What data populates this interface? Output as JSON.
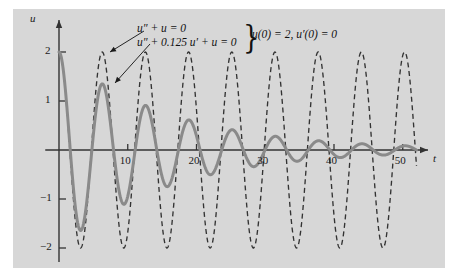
{
  "figure": {
    "background": "#ffffff",
    "panel_color": "#d7d7d7",
    "axis_color": "#333333",
    "solid_curve_color": "#8a8a8a",
    "dashed_curve_color": "#333333"
  },
  "axes": {
    "x_axis_label": "t",
    "y_axis_label": "u",
    "x_ticks": [
      10,
      20,
      30,
      40,
      50
    ],
    "x_tick_labels": [
      "10",
      "20",
      "30",
      "40",
      "50"
    ],
    "y_ticks": [
      2,
      1,
      -1,
      -2
    ],
    "y_tick_labels": [
      "2",
      "1",
      "−1",
      "−2"
    ],
    "x_range": [
      -1,
      54
    ],
    "y_range": [
      -2.45,
      2.45
    ]
  },
  "annotations": {
    "equation_undamped": "u″ + u = 0",
    "equation_damped": "u″ + 0.125 u′ + u = 0",
    "brace": "}",
    "initial_conditions": "u(0) = 2, u′(0) = 0"
  },
  "chart_data": {
    "type": "line",
    "title": "",
    "xlabel": "t",
    "ylabel": "u",
    "xlim": [
      -1,
      54
    ],
    "ylim": [
      -2.45,
      2.45
    ],
    "grid": false,
    "legend": "annotated-with-arrows",
    "series": [
      {
        "name": "u″ + u = 0",
        "style": "dashed",
        "color": "#333333",
        "formula": "2*cos(t)",
        "amplitude": 2,
        "damping": 0,
        "period": 6.2832,
        "initial_value": 2,
        "initial_derivative": 0,
        "t_start": 0,
        "t_end": 52,
        "peaks_t": [
          0,
          6.28,
          12.57,
          18.85,
          25.13,
          31.42,
          37.7,
          43.98,
          50.27
        ],
        "peaks_u": [
          2,
          2,
          2,
          2,
          2,
          2,
          2,
          2,
          2
        ],
        "troughs_t": [
          3.14,
          9.42,
          15.71,
          21.99,
          28.27,
          34.56,
          40.84,
          47.12
        ],
        "troughs_u": [
          -2,
          -2,
          -2,
          -2,
          -2,
          -2,
          -2,
          -2
        ]
      },
      {
        "name": "u″ + 0.125 u′ + u = 0",
        "style": "solid",
        "color": "#8a8a8a",
        "formula": "2*exp(-0.0625*t)*(cos(w*t) + (0.0625/w)*sin(w*t)), w = 0.998",
        "amplitude_envelope": "2*exp(-0.0625*t)",
        "damping_coefficient": 0.125,
        "initial_value": 2,
        "initial_derivative": 0,
        "t_start": 0,
        "t_end": 52,
        "peaks_t": [
          0,
          6.29,
          12.58,
          18.88,
          25.17,
          31.46,
          37.75,
          44.05,
          50.34
        ],
        "peaks_u": [
          2,
          1.35,
          0.91,
          0.62,
          0.42,
          0.28,
          0.19,
          0.13,
          0.087
        ],
        "troughs_t": [
          3.15,
          9.44,
          15.73,
          22.02,
          28.31,
          34.6,
          40.9,
          47.19
        ],
        "troughs_u": [
          -1.64,
          -1.11,
          -0.75,
          -0.51,
          -0.35,
          -0.23,
          -0.16,
          -0.11
        ]
      }
    ]
  }
}
